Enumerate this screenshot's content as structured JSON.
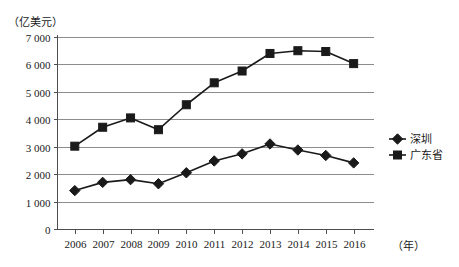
{
  "chart_data": {
    "type": "line",
    "title": "",
    "subtitle": "",
    "ylabel": "（亿美元）",
    "xlabel": "（年）",
    "categories": [
      "2006",
      "2007",
      "2008",
      "2009",
      "2010",
      "2011",
      "2012",
      "2013",
      "2014",
      "2015",
      "2016"
    ],
    "x": [
      2006,
      2007,
      2008,
      2009,
      2010,
      2011,
      2012,
      2013,
      2014,
      2015,
      2016
    ],
    "series": [
      {
        "name": "深圳",
        "marker": "diamond",
        "color": "#1a1a1a",
        "values": [
          1400,
          1700,
          1800,
          1650,
          2050,
          2480,
          2740,
          3100,
          2880,
          2680,
          2410
        ]
      },
      {
        "name": "广东省",
        "marker": "square",
        "color": "#1a1a1a",
        "values": [
          3020,
          3710,
          4050,
          3620,
          4530,
          5330,
          5760,
          6400,
          6500,
          6470,
          6030
        ]
      }
    ],
    "ylim": [
      0,
      7000
    ],
    "yticks": [
      0,
      1000,
      2000,
      3000,
      4000,
      5000,
      6000,
      7000
    ],
    "ytick_labels": [
      "0",
      "1 000",
      "2 000",
      "3 000",
      "4 000",
      "5 000",
      "6 000",
      "7 000"
    ],
    "grid": true,
    "grid_axis": "y",
    "legend_position": "right"
  },
  "legend": {
    "items": [
      {
        "label": "深圳",
        "marker": "diamond"
      },
      {
        "label": "广东省",
        "marker": "square"
      }
    ]
  }
}
